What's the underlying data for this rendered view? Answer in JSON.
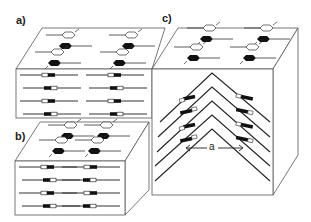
{
  "panels": [
    {
      "id": "a",
      "label": "a)",
      "description": "smectic layers, bookshelf geometry"
    },
    {
      "id": "b",
      "label": "b)",
      "description": "smectic layers, bookshelf geometry (twisted)"
    },
    {
      "id": "c",
      "label": "c)",
      "description": "chevron layer structure"
    }
  ],
  "annotations": {
    "chevron_period": "a"
  },
  "colors": {
    "line": "#333333",
    "molecule_dark": "#111111",
    "molecule_light": "#ffffff",
    "background": "#ffffff"
  }
}
